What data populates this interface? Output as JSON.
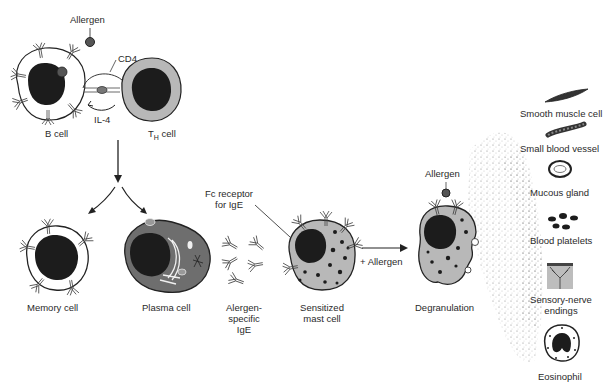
{
  "diagram": {
    "type": "allergic-reaction-pathway",
    "labels": {
      "allergen_top": "Allergen",
      "cd4": "CD4",
      "il4": "IL-4",
      "b_cell": "B cell",
      "th_cell_main": "T",
      "th_cell_sub": "H",
      "th_cell_suffix": " cell",
      "memory_cell": "Memory cell",
      "plasma_cell": "Plasma cell",
      "allergen_specific_ige_1": "Alergen-",
      "allergen_specific_ige_2": "specific",
      "allergen_specific_ige_3": "IgE",
      "fc_receptor_1": "Fc receptor",
      "fc_receptor_2": "for IgE",
      "sensitized_1": "Sensitized",
      "sensitized_2": "mast cell",
      "plus_allergen": "+ Allergen",
      "allergen_degran": "Allergen",
      "degranulation": "Degranulation"
    },
    "targets": [
      {
        "label": "Smooth muscle cell",
        "icon": "smooth-muscle-cell"
      },
      {
        "label": "Small blood vessel",
        "icon": "blood-vessel"
      },
      {
        "label": "Mucous gland",
        "icon": "mucous-gland"
      },
      {
        "label": "Blood platelets",
        "icon": "platelets"
      },
      {
        "label": "Sensory-nerve",
        "label2": "endings",
        "icon": "nerve-endings"
      },
      {
        "label": "Eosinophil",
        "icon": "eosinophil"
      }
    ],
    "colors": {
      "nucleus": "#1c1c1c",
      "cytoplasm_gray": "#b8b8b8",
      "plasma_gray": "#6e6e6e",
      "outline": "#222222",
      "background": "#ffffff"
    }
  }
}
